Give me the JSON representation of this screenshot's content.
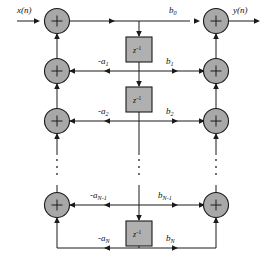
{
  "figure": {
    "background_color": "#ffffff",
    "line_color": "#1a1a1a",
    "adder_fill": "#a8a8a8",
    "delay_fill": "#b0b0b0"
  },
  "signals": {
    "input_label": "x(n)",
    "output_label": "y(n)"
  },
  "adder_symbol": "+",
  "delay_blocks": [
    {
      "label": "z",
      "exponent": "-1"
    },
    {
      "label": "z",
      "exponent": "-1"
    },
    {
      "label": "z",
      "exponent": "-1"
    }
  ],
  "feedback_coefficients": [
    {
      "label": "-a",
      "subscript": "1"
    },
    {
      "label": "-a",
      "subscript": "2"
    },
    {
      "label": "-a",
      "subscript": "N-1"
    },
    {
      "label": "-a",
      "subscript": "N"
    }
  ],
  "feedforward_coefficients": [
    {
      "label": "b",
      "subscript": "0"
    },
    {
      "label": "b",
      "subscript": "1"
    },
    {
      "label": "b",
      "subscript": "2"
    },
    {
      "label": "b",
      "subscript": "N-1"
    },
    {
      "label": "b",
      "subscript": "N"
    }
  ],
  "ellipses": [
    {
      "name": "left-column-ellipsis"
    },
    {
      "name": "center-column-ellipsis"
    },
    {
      "name": "right-column-ellipsis"
    }
  ],
  "rows": [
    {
      "name": "row-0",
      "y": 21
    },
    {
      "name": "row-1",
      "y": 71
    },
    {
      "name": "row-2",
      "y": 121
    },
    {
      "name": "row-n-minus-1",
      "y": 205
    },
    {
      "name": "row-n",
      "y": 248
    }
  ]
}
